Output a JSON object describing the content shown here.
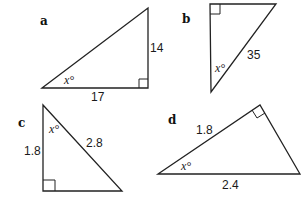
{
  "triangles": [
    {
      "id": "a",
      "label": "a",
      "right_angle": "bottom-right",
      "sides": {
        "opposite": "14",
        "adjacent": "17"
      },
      "angle_label": "x°"
    },
    {
      "id": "b",
      "label": "b",
      "right_angle": "top-left",
      "sides": {
        "hypotenuse": "35"
      },
      "angle_label": "x°"
    },
    {
      "id": "c",
      "label": "c",
      "right_angle": "bottom-left",
      "sides": {
        "adjacent": "1.8",
        "hypotenuse": "2.8"
      },
      "angle_label": "x°"
    },
    {
      "id": "d",
      "label": "d",
      "right_angle": "top",
      "sides": {
        "adjacent": "1.8",
        "hypotenuse": "2.4"
      },
      "angle_label": "x°"
    }
  ]
}
